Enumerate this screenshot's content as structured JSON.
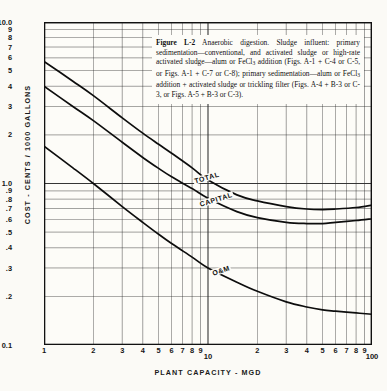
{
  "figure": {
    "caption_label": "Figure L-2",
    "caption_text": " Anaerobic digestion. Sludge influent: primary sedimentation—conventional, and activated sludge or high-rate activated sludge—alum or FeCl3 addition (Figs. A-1 + C-4 or C-5, or Figs. A-1 + C-7 or C-8); primary sedimentation—alum or FeCl3 addition + activated sludge or trickling filter (Figs. A-4 + B-3 or C-3, or Figs. A-5 + B-3 or C-3)."
  },
  "chart_data": {
    "type": "line",
    "title": "Figure L-2 Anaerobic digestion",
    "xlabel": "PLANT CAPACITY - MGD",
    "ylabel": "COST - CENTS / 1000 GALLONS",
    "xscale": "log",
    "yscale": "log",
    "xlim": [
      1,
      100
    ],
    "ylim": [
      0.1,
      10.0
    ],
    "grid": true,
    "legend": "inline-curve-labels",
    "xticks": [
      1,
      2,
      3,
      4,
      5,
      6,
      7,
      8,
      9,
      10,
      20,
      30,
      40,
      50,
      60,
      70,
      80,
      90,
      100
    ],
    "xticklabels": [
      "1",
      "2",
      "3",
      "4",
      "5",
      "6",
      "7",
      "8",
      "9",
      "10",
      "2",
      "3",
      "4",
      "5",
      "6",
      "7",
      "8",
      "9",
      "100"
    ],
    "yticks": [
      0.1,
      0.2,
      0.3,
      0.4,
      0.5,
      0.6,
      0.7,
      0.8,
      0.9,
      1.0,
      2,
      3,
      4,
      5,
      6,
      7,
      8,
      9,
      10.0
    ],
    "yticklabels": [
      "0.1",
      ".2",
      ".3",
      ".4",
      ".5",
      ".6",
      ".7",
      ".8",
      ".9",
      "1.0",
      "2",
      "3",
      "4",
      "5",
      "6",
      "7",
      "8",
      "9",
      "10.0"
    ],
    "series": [
      {
        "name": "TOTAL",
        "label": "TOTAL",
        "x": [
          1,
          1.5,
          2,
          3,
          4,
          5,
          6,
          8,
          10,
          15,
          20,
          30,
          40,
          50,
          60,
          80,
          100
        ],
        "y": [
          5.7,
          4.3,
          3.5,
          2.55,
          2.05,
          1.75,
          1.54,
          1.25,
          1.05,
          0.85,
          0.78,
          0.72,
          0.695,
          0.69,
          0.695,
          0.71,
          0.735
        ]
      },
      {
        "name": "CAPITAL",
        "label": "CAPITAL",
        "x": [
          1,
          1.5,
          2,
          3,
          4,
          5,
          6,
          8,
          10,
          15,
          20,
          30,
          40,
          50,
          60,
          80,
          100
        ],
        "y": [
          4.0,
          3.0,
          2.45,
          1.8,
          1.45,
          1.24,
          1.1,
          0.93,
          0.81,
          0.67,
          0.615,
          0.575,
          0.565,
          0.565,
          0.575,
          0.59,
          0.605
        ]
      },
      {
        "name": "O&M",
        "label": "O&M",
        "x": [
          1,
          1.5,
          2,
          3,
          4,
          5,
          6,
          8,
          10,
          15,
          20,
          30,
          40,
          50,
          60,
          80,
          100
        ],
        "y": [
          1.7,
          1.25,
          1.0,
          0.72,
          0.575,
          0.485,
          0.425,
          0.35,
          0.3,
          0.245,
          0.215,
          0.185,
          0.172,
          0.165,
          0.162,
          0.158,
          0.155
        ]
      }
    ],
    "curve_labels": [
      {
        "name": "TOTAL",
        "x_px": 193,
        "y_px": 174,
        "rotate": -16
      },
      {
        "name": "CAPITAL",
        "x_px": 198,
        "y_px": 196,
        "rotate": -17
      },
      {
        "name": "O&M",
        "x_px": 211,
        "y_px": 267,
        "rotate": -18
      }
    ]
  }
}
